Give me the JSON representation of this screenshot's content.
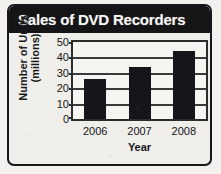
{
  "card": {
    "title": "Sales of DVD Recorders"
  },
  "chart_data": {
    "type": "bar",
    "title": "Sales of DVD Recorders",
    "xlabel": "Year",
    "ylabel": "Number of Units (millions)",
    "ylabel_lines": [
      "Number of Units",
      "(millions)"
    ],
    "categories": [
      "2006",
      "2007",
      "2008"
    ],
    "values": [
      26,
      34,
      44
    ],
    "ylim": [
      0,
      50
    ],
    "ytick_interval": 10,
    "ytick_labels": [
      "50",
      "40",
      "30",
      "20",
      "10",
      "0"
    ],
    "ytick_values": [
      50,
      40,
      30,
      20,
      10,
      0
    ],
    "grid": true,
    "legend": "none",
    "bar_color": "#16161a",
    "plot_background": "#f6f5f2",
    "frame_color": "#2c2c2e",
    "title_banner_color": "#151517",
    "title_text_color": "#f6f6f4"
  }
}
